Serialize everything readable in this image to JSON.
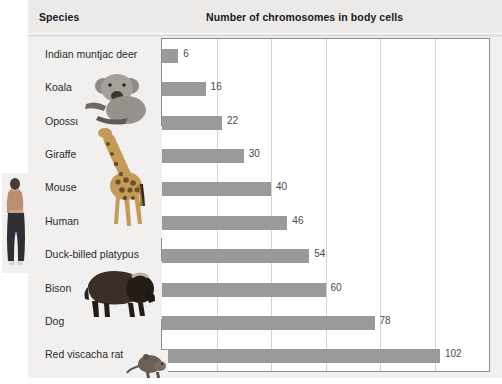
{
  "table": {
    "headers": {
      "species": "Species",
      "chromosomes": "Number of chromosomes in body cells"
    }
  },
  "chart_data": {
    "type": "bar",
    "orientation": "horizontal",
    "title": "Number of chromosomes in body cells",
    "xlabel": "",
    "ylabel": "Species",
    "categories": [
      "Indian muntjac deer",
      "Koala",
      "Opossum",
      "Giraffe",
      "Mouse",
      "Human",
      "Duck-billed platypus",
      "Bison",
      "Dog",
      "Red viscacha rat"
    ],
    "values": [
      6,
      16,
      22,
      30,
      40,
      46,
      54,
      60,
      78,
      102
    ],
    "value_labels": [
      "6",
      "16",
      "22",
      "30",
      "40",
      "46",
      "54",
      "60",
      "78",
      "102"
    ],
    "xlim": [
      0,
      120
    ],
    "gridlines": [
      20,
      40,
      60,
      80,
      100
    ],
    "grid": true,
    "legend": "none",
    "bar_color": "#9a9a9a",
    "plot_background": "#ffffff",
    "plot_border_color": "#8c8c8c"
  },
  "images": [
    {
      "name": "human-photo",
      "caption": "Human"
    },
    {
      "name": "koala-photo",
      "caption": "Koala"
    },
    {
      "name": "giraffe-photo",
      "caption": "Giraffe"
    },
    {
      "name": "bison-photo",
      "caption": "Bison"
    },
    {
      "name": "rat-photo",
      "caption": "Red viscacha rat"
    }
  ],
  "colors": {
    "bar": "#9a9a9a",
    "header_band": "#ebeae8",
    "paper": "#f1f0ee",
    "text": "#2b2b2d",
    "grid": "#d2d2d2"
  }
}
